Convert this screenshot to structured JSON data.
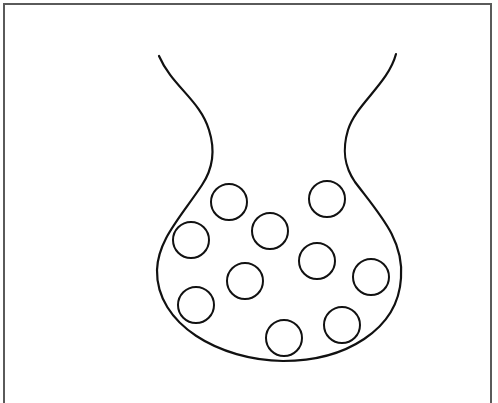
{
  "diagram": {
    "type": "line-drawing",
    "colors": {
      "stroke": "#111111",
      "frame": "#5a5a5a",
      "background": "#ffffff"
    },
    "vessel": {
      "path": "M159,56 C172,86 200,100 209,130 C216,152 212,170 202,185 C180,218 158,240 157,270 C156,325 220,360 283,361 C345,361 398,330 401,278 C404,240 380,215 355,182 C344,166 342,150 348,130 C356,104 388,84 396,54"
    },
    "particles": [
      {
        "cx": 229,
        "cy": 202,
        "r": 18
      },
      {
        "cx": 191,
        "cy": 240,
        "r": 18
      },
      {
        "cx": 270,
        "cy": 231,
        "r": 18
      },
      {
        "cx": 327,
        "cy": 199,
        "r": 18
      },
      {
        "cx": 317,
        "cy": 261,
        "r": 18
      },
      {
        "cx": 245,
        "cy": 281,
        "r": 18
      },
      {
        "cx": 371,
        "cy": 277,
        "r": 18
      },
      {
        "cx": 196,
        "cy": 305,
        "r": 18
      },
      {
        "cx": 284,
        "cy": 338,
        "r": 18
      },
      {
        "cx": 342,
        "cy": 325,
        "r": 18
      }
    ]
  }
}
